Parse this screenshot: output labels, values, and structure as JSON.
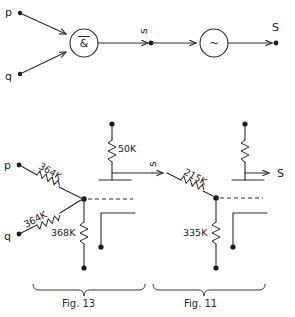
{
  "figure": {
    "background_color": "#ffffff",
    "ink_color": "#2b2b2b"
  },
  "top_circuit": {
    "name": "logic-gate-diagram",
    "inputs": [
      {
        "label": "p",
        "terminal": "dot"
      },
      {
        "label": "q",
        "terminal": "dot"
      }
    ],
    "gates": [
      {
        "name": "nand-gate",
        "symbol": "&",
        "overline": true,
        "shape": "circle"
      },
      {
        "name": "inverter-gate",
        "symbol": "~",
        "overline": false,
        "shape": "circle"
      }
    ],
    "nodes": [
      {
        "label": "s",
        "rotated": true,
        "terminal": "dot"
      }
    ],
    "output": {
      "label": "S",
      "terminal": "dot"
    }
  },
  "bottom_circuit": {
    "name": "resistor-network-diagram",
    "inputs": [
      {
        "label": "p",
        "terminal": "dot"
      },
      {
        "label": "q",
        "terminal": "dot"
      }
    ],
    "resistors": [
      {
        "name": "resistor-364k-p",
        "value": "364K",
        "orientation": "diagonal"
      },
      {
        "name": "resistor-364k-q",
        "value": "364K",
        "orientation": "diagonal"
      },
      {
        "name": "resistor-368k",
        "value": "368K",
        "orientation": "vertical"
      },
      {
        "name": "resistor-50k",
        "value": "50K",
        "orientation": "vertical"
      },
      {
        "name": "resistor-215k",
        "value": "215K",
        "orientation": "diagonal"
      },
      {
        "name": "resistor-335k",
        "value": "335K",
        "orientation": "vertical"
      },
      {
        "name": "resistor-supply-right",
        "value": "",
        "orientation": "vertical"
      }
    ],
    "intermediate_node": {
      "label": "s",
      "rotated": true
    },
    "output": {
      "label": "S"
    }
  },
  "captions": [
    {
      "name": "caption-fig-13",
      "label": "Fig. 13"
    },
    {
      "name": "caption-fig-11",
      "label": "Fig. 11"
    }
  ]
}
